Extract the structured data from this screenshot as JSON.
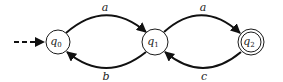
{
  "diagram": {
    "type": "finite-automaton",
    "states": [
      {
        "id": "q0",
        "name": "q",
        "subscript": "0",
        "initial": true,
        "accepting": false
      },
      {
        "id": "q1",
        "name": "q",
        "subscript": "1",
        "initial": false,
        "accepting": false
      },
      {
        "id": "q2",
        "name": "q",
        "subscript": "2",
        "initial": false,
        "accepting": true
      }
    ],
    "transitions": [
      {
        "from": "q0",
        "to": "q1",
        "label": "a"
      },
      {
        "from": "q1",
        "to": "q0",
        "label": "b"
      },
      {
        "from": "q1",
        "to": "q2",
        "label": "a"
      },
      {
        "from": "q2",
        "to": "q1",
        "label": "c"
      }
    ],
    "colors": {
      "stroke": "#111111",
      "fill": "#ffffff",
      "text": "#222222"
    }
  }
}
